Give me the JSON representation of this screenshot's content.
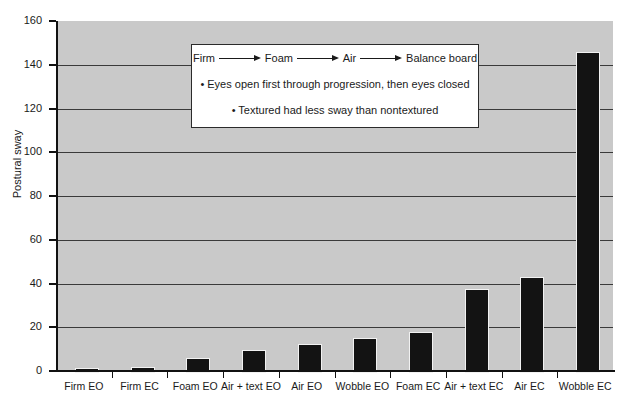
{
  "chart_data": {
    "type": "bar",
    "title": "",
    "xlabel": "",
    "ylabel": "Postural sway",
    "ylim": [
      0,
      160
    ],
    "ytick_step": 20,
    "yticks": [
      0,
      20,
      40,
      60,
      80,
      100,
      120,
      140,
      160
    ],
    "grid": true,
    "legend_position": "inside-top-center",
    "categories": [
      "Firm EO",
      "Firm EC",
      "Foam EO",
      "Air + text EO",
      "Air EO",
      "Wobble EO",
      "Foam EC",
      "Air + text EC",
      "Air EC",
      "Wobble EC"
    ],
    "values": [
      1.5,
      2,
      6,
      9.5,
      12.5,
      15,
      18,
      37.5,
      43,
      146
    ],
    "bar_color": "#131313",
    "plot_background": "#c9c9c9"
  },
  "annotation": {
    "progression": {
      "terms": [
        "Firm",
        "Foam",
        "Air",
        "Balance board"
      ],
      "arrow_glyph": "right-arrow"
    },
    "bullets": [
      "• Eyes open first through progression, then eyes closed",
      "• Textured had less sway than nontextured"
    ]
  }
}
